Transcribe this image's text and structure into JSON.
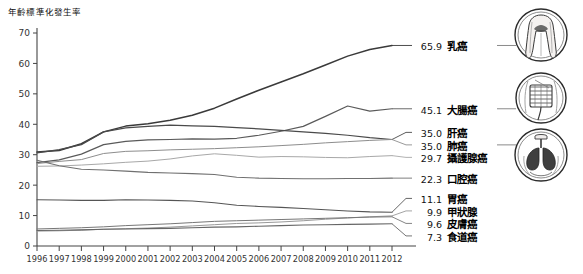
{
  "chart_data": {
    "type": "line",
    "title": "",
    "xlabel": "",
    "ylabel": "年齡標準化發生率",
    "ylim": [
      0,
      70
    ],
    "ytick_step": 10,
    "yticks": [
      "0",
      "10",
      "20",
      "30",
      "40",
      "50",
      "60",
      "70"
    ],
    "grid": false,
    "legend_position": "right",
    "x": [
      1996,
      1997,
      1998,
      1999,
      2000,
      2001,
      2002,
      2003,
      2004,
      2005,
      2006,
      2007,
      2008,
      2009,
      2010,
      2011,
      2012
    ],
    "categories": [
      "1996",
      "1997",
      "1998",
      "1999",
      "2000",
      "2001",
      "2002",
      "2003",
      "2004",
      "2005",
      "2006",
      "2007",
      "2008",
      "2009",
      "2010",
      "2011",
      "2012"
    ],
    "series": [
      {
        "name": "乳癌",
        "end_value": 65.9,
        "values": [
          30.9,
          31.4,
          33.6,
          37.5,
          39.4,
          40.2,
          41.3,
          43.0,
          45.3,
          48.3,
          51.2,
          53.9,
          56.6,
          59.5,
          62.4,
          64.6,
          65.9
        ]
      },
      {
        "name": "大腸癌",
        "end_value": 45.1,
        "values": [
          27.4,
          28.3,
          30.2,
          33.3,
          34.4,
          34.9,
          35.0,
          35.2,
          35.1,
          35.4,
          36.4,
          37.7,
          39.3,
          42.6,
          46.0,
          44.3,
          45.1
        ]
      },
      {
        "name": "肝癌",
        "end_value": 35.0,
        "values": [
          30.6,
          31.7,
          33.3,
          37.5,
          38.8,
          39.3,
          39.7,
          39.5,
          39.3,
          38.9,
          38.5,
          38.0,
          37.5,
          37.0,
          36.4,
          35.6,
          35.0
        ]
      },
      {
        "name": "肺癌",
        "end_value": 35.0,
        "values": [
          27.1,
          27.8,
          28.4,
          30.4,
          31.1,
          31.3,
          31.6,
          31.8,
          32.0,
          32.3,
          32.6,
          33.0,
          33.4,
          33.9,
          34.3,
          34.7,
          35.0
        ]
      },
      {
        "name": "攝護腺癌",
        "end_value": 29.7,
        "values": [
          26.2,
          26.3,
          26.6,
          27.0,
          27.5,
          27.9,
          28.6,
          29.6,
          30.3,
          29.8,
          29.2,
          29.4,
          29.3,
          29.1,
          29.0,
          29.4,
          29.7
        ]
      },
      {
        "name": "口腔癌",
        "end_value": 22.3,
        "values": [
          28.2,
          26.4,
          25.2,
          25.0,
          24.6,
          24.2,
          24.0,
          23.8,
          23.5,
          22.6,
          22.3,
          22.2,
          22.1,
          22.1,
          22.2,
          22.2,
          22.3
        ]
      },
      {
        "name": "胃癌",
        "end_value": 11.1,
        "values": [
          15.2,
          15.1,
          15.0,
          15.0,
          15.2,
          15.1,
          15.0,
          14.8,
          14.2,
          13.4,
          13.0,
          12.7,
          12.3,
          11.9,
          11.5,
          11.2,
          11.1
        ]
      },
      {
        "name": "甲狀腺",
        "end_value": 9.9,
        "values": [
          4.9,
          5.0,
          5.2,
          5.5,
          5.7,
          5.9,
          6.2,
          6.6,
          7.0,
          7.4,
          7.6,
          7.9,
          8.3,
          8.8,
          9.2,
          9.6,
          9.9
        ]
      },
      {
        "name": "皮膚癌",
        "end_value": 9.6,
        "values": [
          5.6,
          5.8,
          6.0,
          6.3,
          6.7,
          7.0,
          7.3,
          7.7,
          8.1,
          8.3,
          8.5,
          8.7,
          8.9,
          9.1,
          9.3,
          9.5,
          9.6
        ]
      },
      {
        "name": "食道癌",
        "end_value": 7.3,
        "values": [
          5.1,
          5.2,
          5.3,
          5.5,
          5.6,
          5.7,
          5.8,
          6.0,
          6.2,
          6.3,
          6.5,
          6.7,
          6.9,
          7.0,
          7.1,
          7.2,
          7.3
        ]
      }
    ]
  },
  "legend": {
    "rows": [
      {
        "value": "65.9",
        "name": "乳癌"
      },
      {
        "value": "45.1",
        "name": "大腸癌"
      },
      {
        "value": "35.0",
        "name": "肝癌"
      },
      {
        "value": "35.0",
        "name": "肺癌"
      },
      {
        "value": "29.7",
        "name": "攝護腺癌"
      },
      {
        "value": "22.3",
        "name": "口腔癌"
      },
      {
        "value": "11.1",
        "name": "胃癌"
      },
      {
        "value": "9.9",
        "name": "甲狀腺"
      },
      {
        "value": "9.6",
        "name": "皮膚癌"
      },
      {
        "value": "7.3",
        "name": "食道癌"
      }
    ]
  },
  "icons": [
    {
      "name": "breast-torso-icon"
    },
    {
      "name": "intestine-icon"
    },
    {
      "name": "lungs-icon"
    }
  ]
}
